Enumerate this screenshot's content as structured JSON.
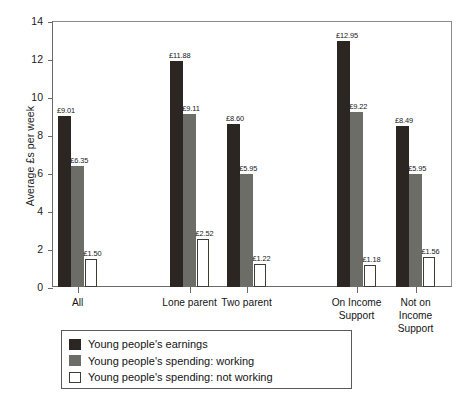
{
  "chart_data": {
    "type": "bar",
    "title": "",
    "xlabel": "",
    "ylabel": "Average £s per week",
    "ylim": [
      0,
      14
    ],
    "yticks": [
      "0",
      "2",
      "4",
      "6",
      "8",
      "10",
      "12",
      "14"
    ],
    "grid": false,
    "legend_position": "below-axes-left",
    "currency": "£",
    "categories": [
      "All",
      "Lone parent",
      "Two parent",
      "On Income Support",
      "Not on Income Support"
    ],
    "category_lines": [
      [
        "All"
      ],
      [
        "Lone parent"
      ],
      [
        "Two parent"
      ],
      [
        "On Income",
        "Support"
      ],
      [
        "Not on",
        "Income",
        "Support"
      ]
    ],
    "series": [
      {
        "name": "Young people's earnings",
        "color": "#2b2622",
        "values": [
          9.01,
          11.88,
          8.6,
          12.95,
          8.49
        ],
        "labels": [
          "£9.01",
          "£11.88",
          "£8.60",
          "£12.95",
          "£8.49"
        ]
      },
      {
        "name": "Young people's spending: working",
        "color": "#6d6d68",
        "values": [
          6.35,
          9.11,
          5.95,
          9.22,
          5.95
        ],
        "labels": [
          "£6.35",
          "£9.11",
          "£5.95",
          "£9.22",
          "£5.95"
        ]
      },
      {
        "name": "Young people's spending: not working",
        "color": "#ffffff",
        "values": [
          1.5,
          2.52,
          1.22,
          1.18,
          1.56
        ],
        "labels": [
          "£1.50",
          "£2.52",
          "£1.22",
          "£1.18",
          "£1.56"
        ]
      }
    ]
  },
  "legend": {
    "items": [
      {
        "label": "Young people's earnings",
        "swatch": "s0"
      },
      {
        "label": "Young people's spending: working",
        "swatch": "s1"
      },
      {
        "label": "Young people's spending: not working",
        "swatch": "s2"
      }
    ]
  }
}
